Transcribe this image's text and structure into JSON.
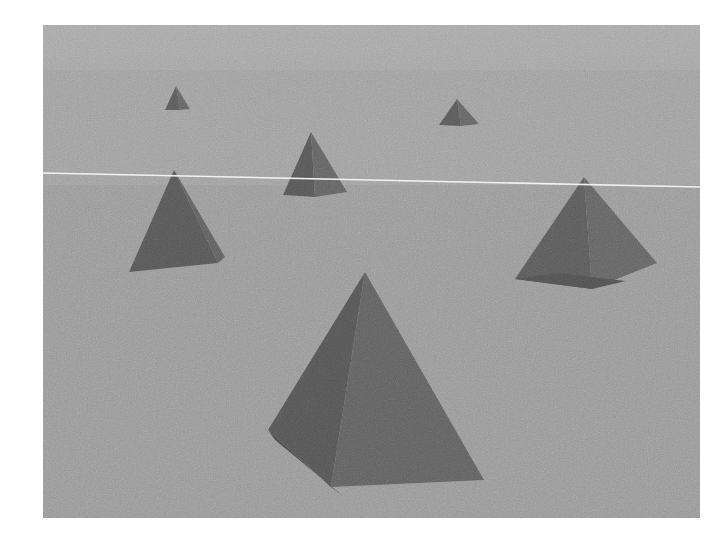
{
  "scene": {
    "title": "3D Rendered Pyramid Scene",
    "canvas": {
      "width": 728,
      "height": 534
    },
    "render_region": {
      "x": 43,
      "y": 25,
      "width": 657,
      "height": 493
    },
    "page_background": "#ffffff",
    "background": {
      "base_color": "#989898",
      "sky_upper_color": "#a3a3a3",
      "sky_mid_color": "#9e9e9e",
      "ground_color": "#989898",
      "band_transition_y": 45,
      "grain": "film-grain-texture"
    },
    "horizon_line": {
      "name": "horizon-line",
      "color": "#e8e8e8",
      "thickness": 1.6,
      "x1": 0,
      "y1": 148,
      "x2": 657,
      "y2": 162
    },
    "object_colors": {
      "face_left_dark": "#575757",
      "face_right_light": "#666666",
      "face_small": "#5d5d5d",
      "edge": "#4e4e4e"
    },
    "objects": [
      {
        "name": "pyramid-small-left",
        "label": "Small pyramid (far left background)",
        "size": "small",
        "apex": {
          "x": 133,
          "y": 61
        },
        "base_left": {
          "x": 122,
          "y": 85
        },
        "base_right": {
          "x": 146,
          "y": 85
        },
        "base_back": {
          "x": 139,
          "y": 81
        },
        "faces": 2,
        "left_face_color": "#5a5a5a",
        "right_face_color": "#636363"
      },
      {
        "name": "pyramid-small-right",
        "label": "Small pyramid (upper right background)",
        "size": "small",
        "apex": {
          "x": 414,
          "y": 74
        },
        "base_left": {
          "x": 396,
          "y": 100
        },
        "base_right": {
          "x": 435,
          "y": 100
        },
        "base_back": {
          "x": 426,
          "y": 94
        },
        "faces": 2,
        "left_face_color": "#585858",
        "right_face_color": "#636363"
      },
      {
        "name": "pyramid-medium-center",
        "label": "Medium pyramid (center, on horizon)",
        "size": "medium",
        "apex": {
          "x": 268,
          "y": 107
        },
        "base_left": {
          "x": 240,
          "y": 170
        },
        "base_right": {
          "x": 303,
          "y": 170
        },
        "base_back": {
          "x": 291,
          "y": 159
        },
        "faces": 2,
        "left_face_color": "#575757",
        "right_face_color": "#626262"
      },
      {
        "name": "pyramid-large-left",
        "label": "Large pyramid (left foreground)",
        "size": "large",
        "apex": {
          "x": 131,
          "y": 145
        },
        "base_left": {
          "x": 86,
          "y": 247
        },
        "base_right": {
          "x": 181,
          "y": 243
        },
        "base_back": {
          "x": 176,
          "y": 226
        },
        "faces": 2,
        "left_face_color": "#565656",
        "right_face_color": "#5e5e5e"
      },
      {
        "name": "pyramid-large-right",
        "label": "Large pyramid (right foreground)",
        "size": "large",
        "apex": {
          "x": 541,
          "y": 152
        },
        "base_left": {
          "x": 472,
          "y": 254
        },
        "base_right": {
          "x": 610,
          "y": 238
        },
        "base_back": {
          "x": 588,
          "y": 264
        },
        "faces": 2,
        "left_face_color": "#5a5a5a",
        "right_face_color": "#636363"
      },
      {
        "name": "pyramid-largest-center",
        "label": "Largest pyramid (center foreground)",
        "size": "largest",
        "apex": {
          "x": 322,
          "y": 247
        },
        "base_left": {
          "x": 225,
          "y": 405
        },
        "base_right": {
          "x": 439,
          "y": 455
        },
        "base_back": {
          "x": 282,
          "y": 471
        },
        "faces": 2,
        "left_face_color": "#545454",
        "right_face_color": "#606060"
      }
    ]
  }
}
